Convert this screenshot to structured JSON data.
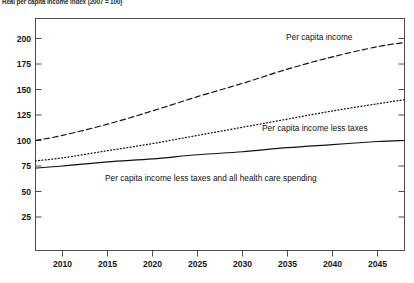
{
  "chart_data": {
    "type": "line",
    "title": "Real per capita income index (2007 = 100)",
    "xlabel": "",
    "ylabel": "",
    "xlim": [
      2007,
      2048
    ],
    "ylim": [
      0,
      212
    ],
    "yticks": [
      25,
      50,
      75,
      100,
      125,
      150,
      175,
      200
    ],
    "xticks": [
      2010,
      2015,
      2020,
      2025,
      2030,
      2035,
      2040,
      2045
    ],
    "grid": false,
    "legend": "inline-annotations",
    "x": [
      2007,
      2010,
      2015,
      2020,
      2025,
      2030,
      2035,
      2040,
      2045,
      2048
    ],
    "series": [
      {
        "name": "Per capita income",
        "style": "dashed",
        "label": "Per capita income",
        "values": [
          100,
          105,
          116,
          129,
          143,
          156,
          170,
          182,
          192,
          196
        ]
      },
      {
        "name": "Per capita income less taxes",
        "style": "dotted",
        "label": "Per capita income less taxes",
        "values": [
          80,
          83,
          90,
          97,
          105,
          113,
          121,
          129,
          136,
          140
        ]
      },
      {
        "name": "Per capita income less taxes and all health care spending",
        "style": "solid",
        "label": "Per capita income less taxes and all health care spending",
        "values": [
          73,
          75,
          79,
          82,
          86,
          89,
          93,
          96,
          99,
          100
        ]
      }
    ]
  },
  "annotations": {
    "label_income": "Per capita income",
    "label_income_less_taxes": "Per capita income less taxes",
    "label_income_less_taxes_health": "Per capita income less taxes and all health care spending"
  },
  "axis": {
    "y_200": "200",
    "y_175": "175",
    "y_150": "150",
    "y_125": "125",
    "y_100": "100",
    "y_75": "75",
    "y_50": "50",
    "y_25": "25",
    "x_2010": "2010",
    "x_2015": "2015",
    "x_2020": "2020",
    "x_2025": "2025",
    "x_2030": "2030",
    "x_2035": "2035",
    "x_2040": "2040",
    "x_2045": "2045"
  }
}
